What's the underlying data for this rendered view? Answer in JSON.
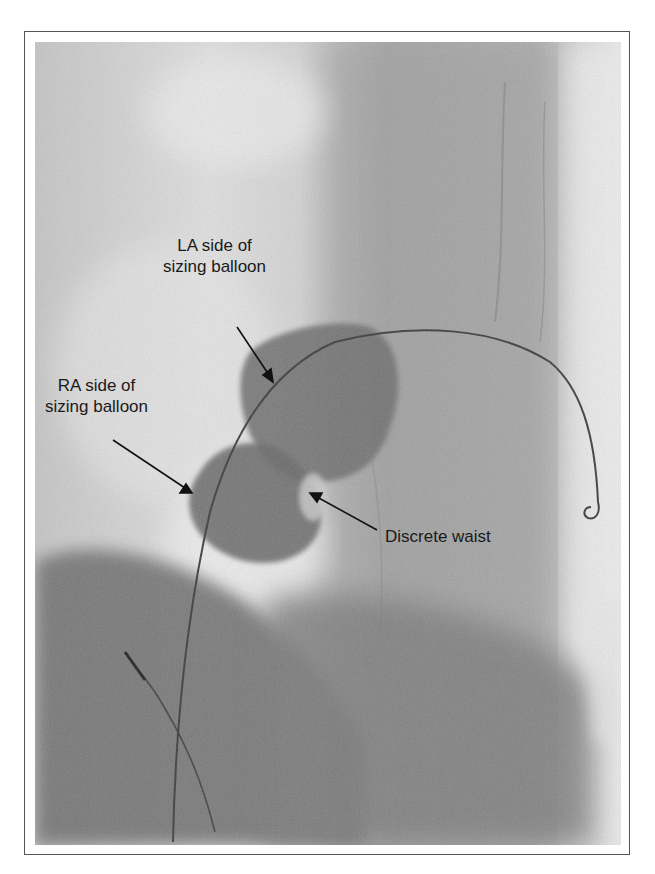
{
  "figure": {
    "type": "fluoroscopy",
    "colors": {
      "background": "#ffffff",
      "frame_border": "#555555",
      "image_base": "#b9b9b9",
      "balloon": "#6f6f6f",
      "text": "#1a1a1a"
    },
    "annotations": [
      {
        "id": "la",
        "lines": [
          "LA side of",
          "sizing balloon"
        ]
      },
      {
        "id": "ra",
        "lines": [
          "RA side of",
          "sizing balloon"
        ]
      },
      {
        "id": "waist",
        "lines": [
          "Discrete waist"
        ]
      }
    ]
  }
}
